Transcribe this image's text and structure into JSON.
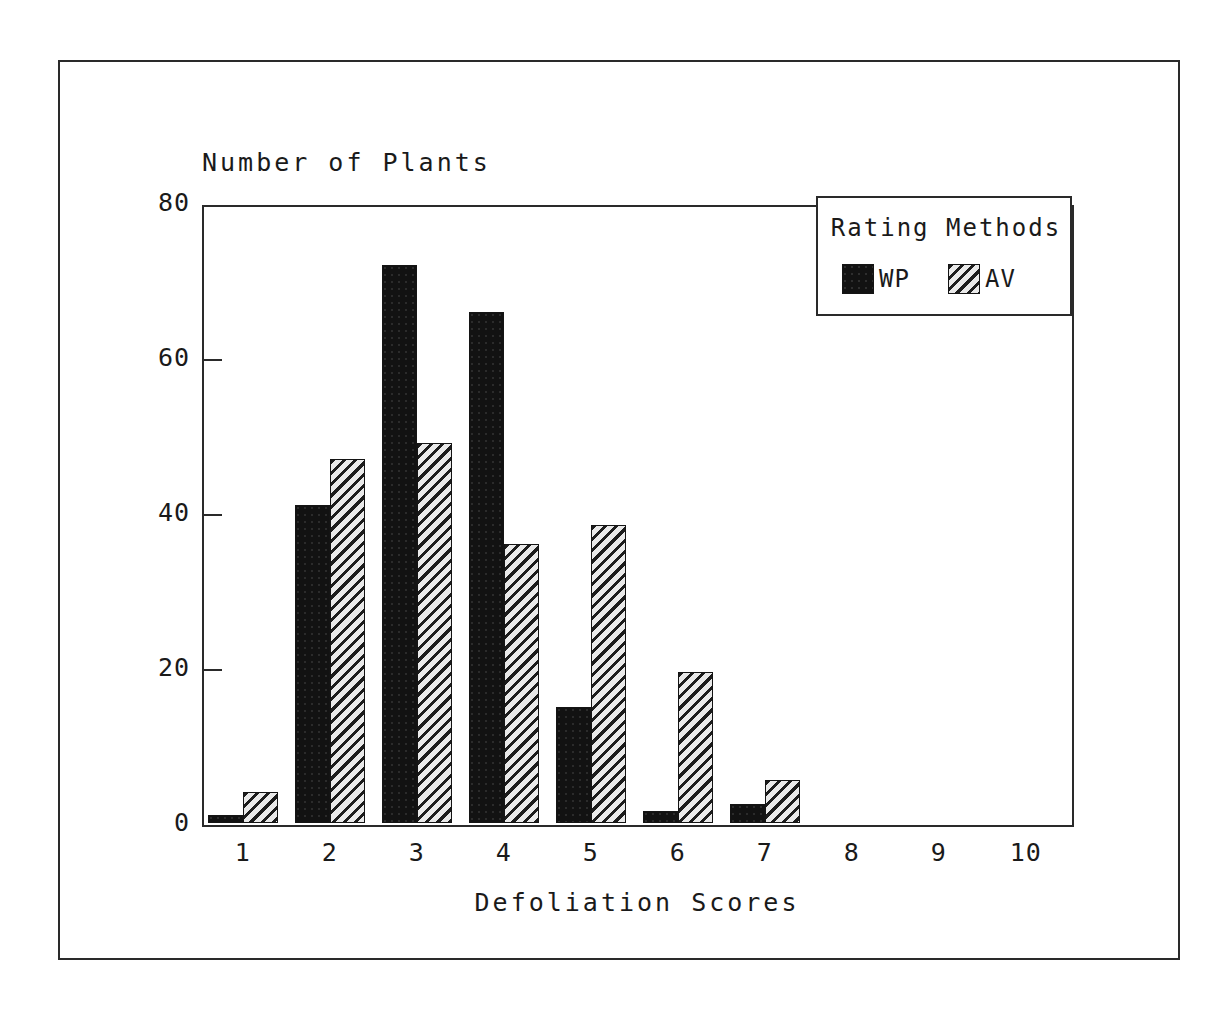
{
  "chart_data": {
    "type": "bar",
    "title": "",
    "xlabel": "Defoliation Scores",
    "ylabel": "Number of Plants",
    "categories": [
      "1",
      "2",
      "3",
      "4",
      "5",
      "6",
      "7",
      "8",
      "9",
      "10"
    ],
    "series": [
      {
        "name": "WP",
        "values": [
          1,
          41,
          72,
          66,
          15,
          1.5,
          2.5,
          0,
          0,
          0
        ]
      },
      {
        "name": "AV",
        "values": [
          4,
          47,
          49,
          36,
          38.5,
          19.5,
          5.5,
          0,
          0,
          0
        ]
      }
    ],
    "ylim": [
      0,
      80
    ],
    "y_ticks": [
      "0",
      "20",
      "40",
      "60",
      "80"
    ],
    "y_tick_values": [
      0,
      20,
      40,
      60,
      80
    ],
    "grid": false,
    "legend_position": "top-right",
    "legend_title": "Rating Methods"
  },
  "legend": {
    "title": "Rating Methods",
    "entries": [
      {
        "label": "WP",
        "pattern": "solid-black"
      },
      {
        "label": "AV",
        "pattern": "diagonal-hatch"
      }
    ]
  },
  "axes": {
    "y_title": "Number of Plants",
    "x_title": "Defoliation Scores"
  },
  "colors": {
    "ink": "#1a1a1a",
    "frame": "#2a2a2a",
    "wp_fill": "#121212",
    "av_fill": "#e9e9e9",
    "av_hatch": "#1c1c1c",
    "background": "#ffffff"
  }
}
